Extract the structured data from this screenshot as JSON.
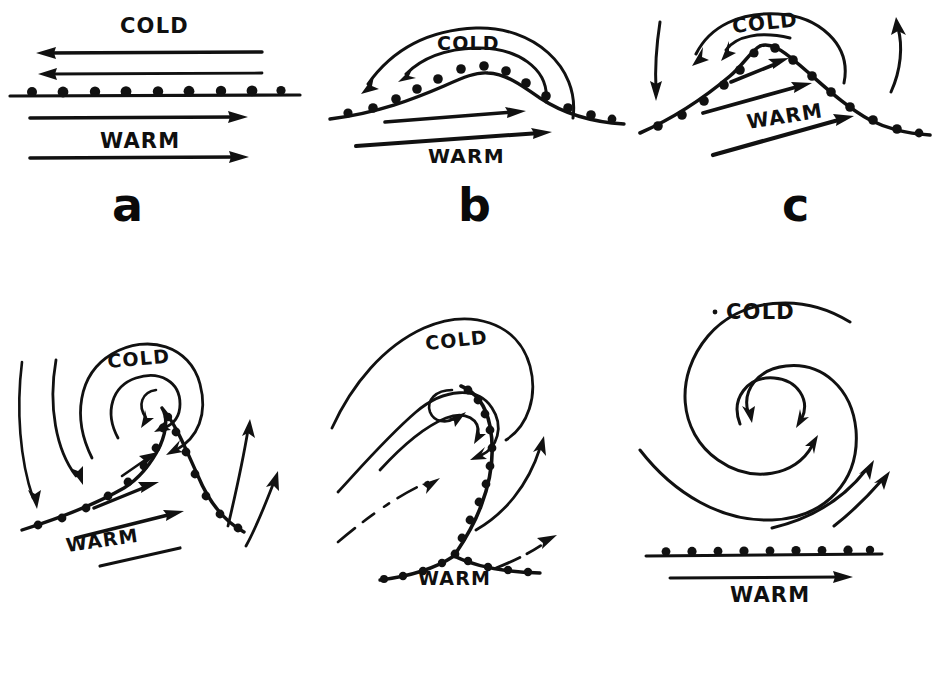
{
  "figure": {
    "background_color": "#ffffff",
    "ink_color": "#111111",
    "width": 947,
    "height": 684,
    "panel_count": 6,
    "layout": "2 rows x 3 columns"
  },
  "labels": {
    "cold": "COLD",
    "warm": "WARM"
  },
  "panels": [
    {
      "letter": "a",
      "stage": "stationary-front",
      "cold_label": "COLD",
      "warm_label": "WARM",
      "cold_arrows": 2,
      "warm_arrows": 2,
      "cold_flow_direction": "left",
      "warm_flow_direction": "right",
      "front_shape": "straight-horizontal"
    },
    {
      "letter": "b",
      "stage": "frontal-wave",
      "cold_label": "COLD",
      "warm_label": "WARM",
      "cold_arrows": 2,
      "warm_arrows": 2,
      "cold_flow_direction": "left-curving",
      "warm_flow_direction": "right",
      "front_shape": "broad-wave-crest"
    },
    {
      "letter": "c",
      "stage": "open-wave",
      "cold_label": "COLD",
      "warm_label": "WARM",
      "cold_arrows": 2,
      "warm_arrows": 3,
      "cold_flow_direction": "left-curving",
      "warm_flow_direction": "right",
      "front_shape": "peaked-wave",
      "extra_arrows": [
        "descending-left",
        "ascending-right"
      ]
    },
    {
      "letter": "d",
      "stage": "mature-cyclone",
      "cold_label": "COLD",
      "warm_label": "WARM",
      "cold_arrows": 3,
      "warm_arrows": 3,
      "cold_flow_direction": "cyclonic-spiral",
      "warm_flow_direction": "right",
      "front_shape": "narrow-warm-sector",
      "extra_arrows": [
        "inflow-left",
        "inflow-left",
        "outflow-right",
        "outflow-right"
      ]
    },
    {
      "letter": "e",
      "stage": "occlusion",
      "cold_label": "COLD",
      "warm_label": "WARM",
      "cold_arrows": 4,
      "warm_arrows": 0,
      "cold_flow_direction": "cyclonic-spiral",
      "warm_flow_direction": "right",
      "front_shape": "occluded-spiral-with-triple-point",
      "extra_arrows": [
        "outflow-right",
        "outflow-right"
      ]
    },
    {
      "letter": "f",
      "stage": "dissipating-vortex",
      "cold_label": "COLD",
      "warm_label": "WARM",
      "cold_arrows": 2,
      "warm_arrows": 1,
      "cold_flow_direction": "closed-vortex",
      "warm_flow_direction": "right",
      "front_shape": "straight-horizontal-detached",
      "extra_arrows": [
        "outflow-right",
        "outflow-right"
      ]
    }
  ]
}
